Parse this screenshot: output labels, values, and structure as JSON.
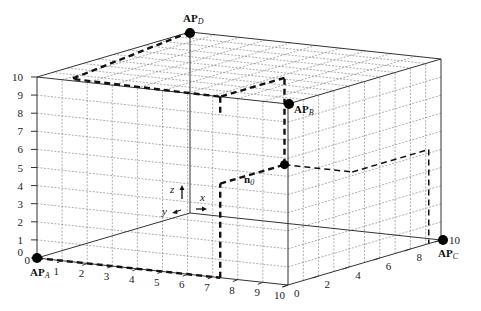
{
  "diagram": {
    "type": "3d-room-grid",
    "access_points": [
      {
        "id": "A",
        "label": "AP",
        "sub": "A",
        "x": 37,
        "y": 258
      },
      {
        "id": "B",
        "label": "AP",
        "sub": "B",
        "x": 289,
        "y": 104
      },
      {
        "id": "C",
        "label": "AP",
        "sub": "C",
        "x": 443,
        "y": 240
      },
      {
        "id": "D",
        "label": "AP",
        "sub": "D",
        "x": 190,
        "y": 33
      }
    ],
    "node": {
      "label": "n",
      "sub": "0",
      "x": 238,
      "y": 177
    },
    "axis_indicators": {
      "z": "z",
      "y": "y",
      "x": "x"
    },
    "z_ticks": [
      "0",
      "1",
      "2",
      "3",
      "4",
      "5",
      "6",
      "7",
      "8",
      "9",
      "10"
    ],
    "x_ticks": [
      "0",
      "1",
      "2",
      "3",
      "4",
      "5",
      "6",
      "7",
      "8",
      "9",
      "10"
    ],
    "y_ticks": [
      "0",
      "2",
      "4",
      "6",
      "8",
      "10"
    ]
  }
}
